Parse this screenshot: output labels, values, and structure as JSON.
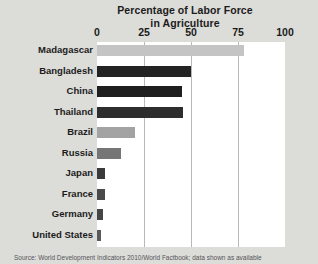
{
  "chart_data": {
    "type": "bar",
    "orientation": "horizontal",
    "title": "Percentage of Labor Force in Agriculture",
    "title_line1": "Percentage of Labor Force",
    "title_line2": "in Agriculture",
    "xlabel": "",
    "ylabel": "",
    "xlim": [
      0,
      100
    ],
    "ticks": [
      "0",
      "25",
      "50",
      "75",
      "100"
    ],
    "tick_values": [
      0,
      25,
      50,
      75,
      100
    ],
    "grid": "vertical",
    "legend": "none",
    "categories": [
      "Madagascar",
      "Bangladesh",
      "China",
      "Thailand",
      "Brazil",
      "Russia",
      "Japan",
      "France",
      "Germany",
      "United States"
    ],
    "values": [
      78,
      50,
      45,
      46,
      20,
      13,
      4,
      4,
      3,
      2
    ],
    "bar_colors": [
      "#c4c4c4",
      "#232323",
      "#1f1f1f",
      "#2d2d2d",
      "#a3a3a3",
      "#767676",
      "#3a3a3a",
      "#4a4a4a",
      "#454545",
      "#5a5a5a"
    ],
    "background_color": "#dcdcd8",
    "plot_background_color": "#ffffff",
    "gridline_color": "#b8b8b4"
  },
  "footer": {
    "source": "Source: World Development Indicators 2010/World Factbook; data shown as available"
  }
}
